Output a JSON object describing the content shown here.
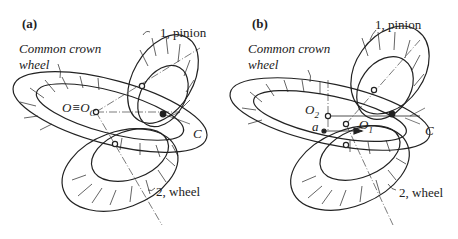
{
  "panels": [
    {
      "id": "a",
      "tag": "(a)",
      "crown_label_1": "Common crown",
      "crown_label_2": "wheel",
      "pinion_label": "1, pinion",
      "wheel_label": "2, wheel",
      "point_O": "O≡O",
      "point_O_sub": "C",
      "point_C": "C"
    },
    {
      "id": "b",
      "tag": "(b)",
      "crown_label_1": "Common crown",
      "crown_label_2": "wheel",
      "pinion_label": "1, pinion",
      "wheel_label": "2, wheel",
      "point_O2": "O",
      "point_O2_sub": "2",
      "point_O1": "O",
      "point_O1_sub": "1",
      "point_a": "a",
      "point_C": "C"
    }
  ],
  "colors": {
    "line": "#222222",
    "background": "#ffffff"
  }
}
